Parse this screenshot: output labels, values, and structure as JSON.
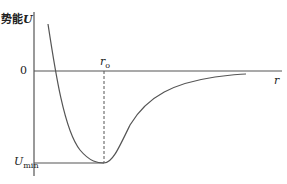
{
  "diagram": {
    "title": "势能U",
    "y_axis_label_prefix": "势能",
    "y_axis_label_var": "U",
    "x_axis_label": "r",
    "zero_label": "0",
    "r0_label_main": "r",
    "r0_label_sub": "o",
    "umin_label_main": "U",
    "umin_label_sub": "min",
    "line_color": "#555555"
  }
}
